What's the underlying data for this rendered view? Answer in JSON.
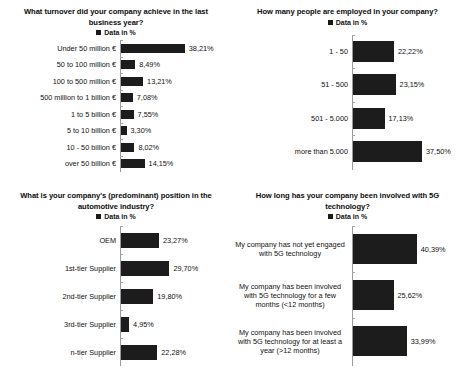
{
  "legend_label": "Data in %",
  "legend_swatch_color": "#1a1a1a",
  "bar_color": "#1c1c1c",
  "charts": [
    {
      "id": "turnover",
      "title": "What turnover did your company achieve in the last business year?",
      "type": "bar",
      "orientation": "horizontal",
      "legend": "Data in %",
      "xlabel": "",
      "ylabel": "",
      "categories": [
        "Under 50 million €",
        "50 to 100 million €",
        "100 to 500 million €",
        "500 million to 1 billion €",
        "1 to 5 billion €",
        "5 to 10 billion €",
        "10 - 50 billion €",
        "over  50 billion €"
      ],
      "values": [
        38.21,
        8.49,
        13.21,
        7.08,
        7.55,
        3.3,
        8.02,
        14.15
      ],
      "value_labels": [
        "38,21%",
        "8,49%",
        "13,21%",
        "7,08%",
        "7,55%",
        "3,30%",
        "8,02%",
        "14,15%"
      ]
    },
    {
      "id": "employees",
      "title": "How many people are employed in your company?",
      "type": "bar",
      "orientation": "horizontal",
      "legend": "Data in %",
      "xlabel": "",
      "ylabel": "",
      "categories": [
        "1 - 50",
        "51 - 500",
        "501 - 5.000",
        "more than 5.000"
      ],
      "values": [
        22.22,
        23.15,
        17.13,
        37.5
      ],
      "value_labels": [
        "22,22%",
        "23,15%",
        "17,13%",
        "37,50%"
      ]
    },
    {
      "id": "position",
      "title": "What is your company's (predominant) position in the automotive industry?",
      "type": "bar",
      "orientation": "horizontal",
      "legend": "Data in %",
      "xlabel": "",
      "ylabel": "",
      "categories": [
        "OEM",
        "1st-tier Supplier",
        "2nd-tier Supplier",
        "3rd-tier Supplier",
        "n-tier Supplier"
      ],
      "values": [
        23.27,
        29.7,
        19.8,
        4.95,
        22.28
      ],
      "value_labels": [
        "23,27%",
        "29,70%",
        "19,80%",
        "4,95%",
        "22,28%"
      ]
    },
    {
      "id": "5g-involvement",
      "title": "How long has your company been involved with 5G technology?",
      "type": "bar",
      "orientation": "horizontal",
      "legend": "Data in %",
      "xlabel": "",
      "ylabel": "",
      "categories": [
        "My company has not yet engaged with 5G technology",
        "My company has been involved with 5G technology for a few months (<12 months)",
        "My company has been involved with 5G technology for at least a year (>12 months)"
      ],
      "values": [
        40.39,
        25.62,
        33.99
      ],
      "value_labels": [
        "40,39%",
        "25,62%",
        "33,99%"
      ]
    }
  ],
  "chart_data": [
    {
      "type": "bar",
      "title": "What turnover did your company achieve in the last business year?",
      "categories": [
        "Under 50 million €",
        "50 to 100 million €",
        "100 to 500 million €",
        "500 million to 1 billion €",
        "1 to 5 billion €",
        "5 to 10 billion €",
        "10 - 50 billion €",
        "over  50 billion €"
      ],
      "values": [
        38.21,
        8.49,
        13.21,
        7.08,
        7.55,
        3.3,
        8.02,
        14.15
      ],
      "xlabel": "",
      "ylabel": "",
      "xlim": [
        0,
        45
      ],
      "legend": [
        "Data in %"
      ],
      "legend_position": "top-center",
      "grid": false,
      "orientation": "horizontal",
      "data_labels": true
    },
    {
      "type": "bar",
      "title": "How many people are employed in your company?",
      "categories": [
        "1 - 50",
        "51 - 500",
        "501 - 5.000",
        "more than 5.000"
      ],
      "values": [
        22.22,
        23.15,
        17.13,
        37.5
      ],
      "xlabel": "",
      "ylabel": "",
      "xlim": [
        0,
        40
      ],
      "legend": [
        "Data in %"
      ],
      "legend_position": "top-center",
      "grid": false,
      "orientation": "horizontal",
      "data_labels": true
    },
    {
      "type": "bar",
      "title": "What is your company's (predominant) position in the automotive industry?",
      "categories": [
        "OEM",
        "1st-tier Supplier",
        "2nd-tier Supplier",
        "3rd-tier Supplier",
        "n-tier Supplier"
      ],
      "values": [
        23.27,
        29.7,
        19.8,
        4.95,
        22.28
      ],
      "xlabel": "",
      "ylabel": "",
      "xlim": [
        0,
        32
      ],
      "legend": [
        "Data in %"
      ],
      "legend_position": "top-center",
      "grid": false,
      "orientation": "horizontal",
      "data_labels": true
    },
    {
      "type": "bar",
      "title": "How long has your company been involved with 5G technology?",
      "categories": [
        "My company has not yet engaged with 5G technology",
        "My company has been involved with 5G technology for a few months (<12 months)",
        "My company has been involved with 5G technology for at least a year (>12 months)"
      ],
      "values": [
        40.39,
        25.62,
        33.99
      ],
      "xlabel": "",
      "ylabel": "",
      "xlim": [
        0,
        45
      ],
      "legend": [
        "Data in %"
      ],
      "legend_position": "top-center",
      "grid": false,
      "orientation": "horizontal",
      "data_labels": true
    }
  ]
}
